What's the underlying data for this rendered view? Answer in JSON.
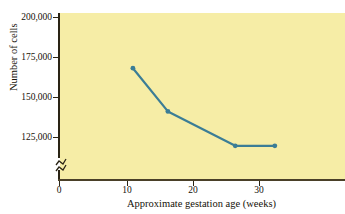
{
  "chart_data": {
    "type": "line",
    "title": "",
    "xlabel": "Approximate gestation age (weeks)",
    "ylabel": "Number of cells",
    "xlim": [
      0,
      43
    ],
    "ylim": [
      118000,
      203000
    ],
    "y_axis_break": true,
    "grid": false,
    "legend": null,
    "xticks": [
      0,
      10,
      20,
      30
    ],
    "xtick_labels": [
      "0",
      "10",
      "20",
      "30"
    ],
    "yticks": [
      125000,
      150000,
      175000,
      200000
    ],
    "ytick_labels": [
      "125,000",
      "150,000",
      "175,000",
      "200,000"
    ],
    "series": [
      {
        "name": "Number of cells",
        "color": "#3b7d96",
        "marker": "circle",
        "x": [
          11.2,
          16.5,
          26.7,
          32.7
        ],
        "values": [
          168000,
          141000,
          119500,
          119500
        ]
      }
    ]
  },
  "axis": {
    "y_labels": [
      "200,000",
      "175,000",
      "150,000",
      "125,000"
    ],
    "x_labels": [
      "0",
      "10",
      "20",
      "30"
    ],
    "y_title": "Number of cells",
    "x_title": "Approximate gestation age (weeks)"
  },
  "colors": {
    "plot_background": "#f6eda6",
    "line": "#3b7d96",
    "axis": "#2a2415",
    "text": "#151208"
  }
}
